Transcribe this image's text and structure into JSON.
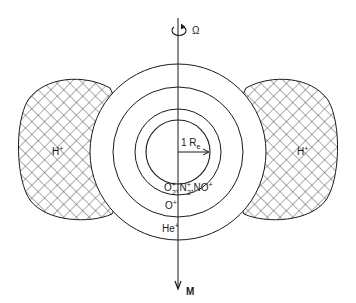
{
  "diagram": {
    "title": "",
    "rotation_axis": {
      "symbol": "Ω",
      "meaning": "rotation axis"
    },
    "magnetic_axis": {
      "symbol": "M"
    },
    "radius_label": {
      "prefix": "1 R",
      "subscript": "e"
    },
    "regions": {
      "lobe_left": {
        "ion": "H",
        "charge": "+"
      },
      "lobe_right": {
        "ion": "H",
        "charge": "+"
      },
      "inner_ions": {
        "o2": {
          "base": "O",
          "sub": "2",
          "sup": "+"
        },
        "sep1": ",",
        "n2": {
          "base": "N",
          "sub": "2",
          "sup": "+"
        },
        "sep2": ",",
        "no": {
          "base": "NO",
          "sup": "+"
        }
      },
      "o_plus": {
        "base": "O",
        "sup": "+"
      },
      "he_plus": {
        "base": "He",
        "sup": "+"
      }
    },
    "colors": {
      "line": "#1a1a1a",
      "background": "#ffffff",
      "hatch": "#333333"
    }
  }
}
